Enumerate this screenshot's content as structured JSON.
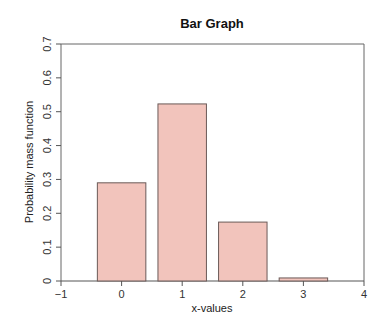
{
  "chart_data": {
    "type": "bar",
    "title": "Bar Graph",
    "xlabel": "x-values",
    "ylabel": "Probability mass function",
    "categories": [
      "0",
      "1",
      "2",
      "3"
    ],
    "x": [
      0,
      1,
      2,
      3
    ],
    "values": [
      0.29,
      0.523,
      0.174,
      0.009
    ],
    "bar_width": 0.8,
    "xlim": [
      -1,
      4
    ],
    "ylim": [
      0,
      0.7
    ],
    "xticks": [
      -1,
      0,
      1,
      2,
      3,
      4
    ],
    "xtick_labels": [
      "−1",
      "0",
      "1",
      "2",
      "3",
      "4"
    ],
    "yticks": [
      0,
      0.1,
      0.2,
      0.3,
      0.4,
      0.5,
      0.6,
      0.7
    ],
    "ytick_labels": [
      "0",
      "0.1",
      "0.2",
      "0.3",
      "0.4",
      "0.5",
      "0.6",
      "0.7"
    ],
    "grid": false,
    "legend": null,
    "colors": {
      "bar_fill": "#f2c4bc",
      "bar_stroke": "#6b5a58",
      "frame": "#666666"
    }
  }
}
